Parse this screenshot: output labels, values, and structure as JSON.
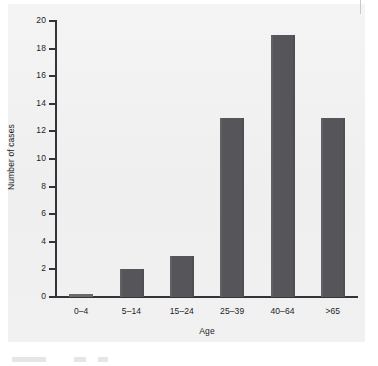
{
  "chart_data": {
    "type": "bar",
    "title": "",
    "xlabel": "Age",
    "ylabel": "Number of cases",
    "categories": [
      "0–4",
      "5–14",
      "15–24",
      "25–39",
      "40–64",
      ">65"
    ],
    "values": [
      0,
      2,
      3,
      13,
      19,
      13
    ],
    "ylim": [
      0,
      20
    ],
    "y_ticks": [
      0,
      2,
      4,
      6,
      8,
      10,
      12,
      14,
      16,
      18,
      20
    ],
    "y_tick_labels": [
      "0",
      "2",
      "4",
      "6",
      "8",
      "10",
      "12",
      "14",
      "16",
      "18",
      "20"
    ],
    "grid": false,
    "legend": false,
    "bar_color": "#58585a",
    "axis_color": "#33343a",
    "plot_background": "#f1f1f1"
  }
}
